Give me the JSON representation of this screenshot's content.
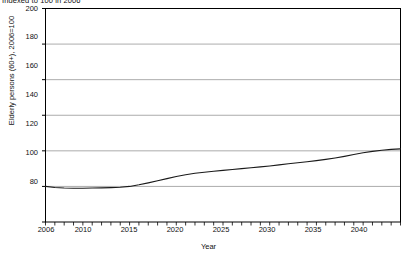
{
  "chart_data": {
    "type": "line",
    "title": "Indexed to 100 in 2006",
    "xlabel": "Year",
    "ylabel": "Elderly persons (60+), 2006=100",
    "xlim": [
      2006,
      2044
    ],
    "ylim": [
      80,
      200
    ],
    "yticks": [
      80,
      100,
      120,
      140,
      160,
      180,
      200
    ],
    "xticks": [
      2006,
      2010,
      2015,
      2020,
      2025,
      2030,
      2035,
      2040
    ],
    "grid": "horizontal",
    "legend": "none",
    "line_color": "#1a1a1a",
    "series": [
      {
        "name": "Elderly persons (60+) index",
        "x": [
          2006,
          2007,
          2008,
          2009,
          2010,
          2011,
          2012,
          2013,
          2014,
          2015,
          2016,
          2017,
          2018,
          2019,
          2020,
          2021,
          2022,
          2023,
          2024,
          2025,
          2026,
          2027,
          2028,
          2029,
          2030,
          2031,
          2032,
          2033,
          2034,
          2035,
          2036,
          2037,
          2038,
          2039,
          2040,
          2041,
          2042,
          2043,
          2044
        ],
        "values": [
          100.0,
          99.4,
          99.1,
          99.0,
          99.0,
          99.1,
          99.2,
          99.3,
          99.5,
          100.0,
          100.9,
          102.0,
          103.2,
          104.4,
          105.6,
          106.6,
          107.4,
          108.0,
          108.5,
          109.0,
          109.5,
          110.0,
          110.5,
          111.0,
          111.5,
          112.1,
          112.7,
          113.3,
          113.9,
          114.5,
          115.2,
          116.0,
          116.9,
          117.9,
          118.9,
          119.7,
          120.3,
          120.8,
          121.1
        ]
      }
    ]
  }
}
